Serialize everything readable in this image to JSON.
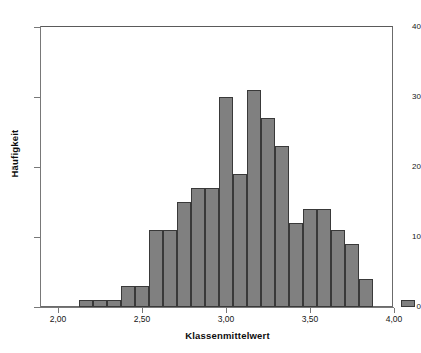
{
  "chart_data": {
    "type": "bar",
    "title": "",
    "subtitle": "",
    "xlabel": "Klassenmittelwert",
    "ylabel": "Häufigkeit",
    "xlim": [
      1.9,
      4.1
    ],
    "ylim": [
      0,
      42
    ],
    "grid": false,
    "legend": null,
    "bin_width": 0.0833,
    "x_ticks": [
      {
        "value": 2.0,
        "label": "2,00"
      },
      {
        "value": 2.5,
        "label": "2,50"
      },
      {
        "value": 3.0,
        "label": "3,00"
      },
      {
        "value": 3.5,
        "label": "3,50"
      },
      {
        "value": 4.0,
        "label": "4,00"
      }
    ],
    "y_ticks": [
      {
        "value": 0,
        "label": "0"
      },
      {
        "value": 10,
        "label": "10"
      },
      {
        "value": 20,
        "label": "20"
      },
      {
        "value": 30,
        "label": "30"
      },
      {
        "value": 40,
        "label": "40"
      }
    ],
    "bar_fill_color": "#808080",
    "bar_border_color": "#393939",
    "axis_color": "#787878",
    "categories": [
      "2,17",
      "2,25",
      "2,33",
      "2,42",
      "2,50",
      "2,58",
      "2,67",
      "2,75",
      "2,83",
      "2,92",
      "3,00",
      "3,08",
      "3,17",
      "3,25",
      "3,33",
      "3,42",
      "3,50",
      "3,58",
      "3,67",
      "3,75",
      "3,83",
      "3,92"
    ],
    "bins": [
      {
        "center": 2.167,
        "count": 1
      },
      {
        "center": 2.25,
        "count": 1
      },
      {
        "center": 2.333,
        "count": 1
      },
      {
        "center": 2.417,
        "count": 3
      },
      {
        "center": 2.5,
        "count": 3
      },
      {
        "center": 2.583,
        "count": 11
      },
      {
        "center": 2.667,
        "count": 11
      },
      {
        "center": 2.75,
        "count": 15
      },
      {
        "center": 2.833,
        "count": 17
      },
      {
        "center": 2.917,
        "count": 17
      },
      {
        "center": 3.0,
        "count": 30
      },
      {
        "center": 3.083,
        "count": 19
      },
      {
        "center": 3.167,
        "count": 31
      },
      {
        "center": 3.25,
        "count": 27
      },
      {
        "center": 3.333,
        "count": 23
      },
      {
        "center": 3.417,
        "count": 12
      },
      {
        "center": 3.5,
        "count": 14
      },
      {
        "center": 3.583,
        "count": 14
      },
      {
        "center": 3.667,
        "count": 11
      },
      {
        "center": 3.75,
        "count": 9
      },
      {
        "center": 3.833,
        "count": 4
      },
      {
        "center": 4.083,
        "count": 1
      }
    ],
    "values": [
      1,
      1,
      1,
      3,
      3,
      11,
      11,
      15,
      17,
      17,
      30,
      19,
      31,
      27,
      23,
      12,
      14,
      14,
      11,
      9,
      4,
      1
    ]
  }
}
